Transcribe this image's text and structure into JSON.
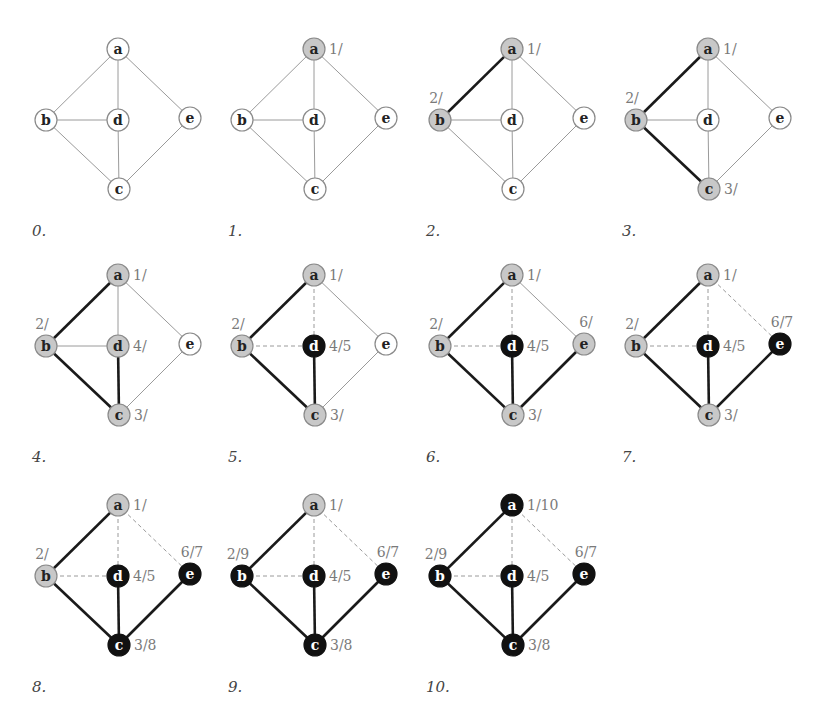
{
  "figure": {
    "colors": {
      "white_fill": "#ffffff",
      "gray_fill": "#c8c8c8",
      "black_fill": "#111111",
      "node_stroke": "#8a8a8a",
      "edge_plain": "#9a9a9a",
      "edge_tree": "#1a1a1a",
      "edge_back": "#9a9a9a",
      "timestamp_text": "#7a7a7a",
      "label_text_light": "#222222",
      "label_text_dark": "#ffffff"
    },
    "vertices": [
      "a",
      "b",
      "c",
      "d",
      "e"
    ],
    "edges": [
      [
        "a",
        "b"
      ],
      [
        "a",
        "d"
      ],
      [
        "a",
        "e"
      ],
      [
        "b",
        "d"
      ],
      [
        "b",
        "c"
      ],
      [
        "d",
        "c"
      ],
      [
        "e",
        "c"
      ]
    ],
    "layout": {
      "a": [
        118,
        49
      ],
      "b": [
        46,
        120
      ],
      "d": [
        118,
        120
      ],
      "e": [
        190,
        118
      ],
      "c": [
        119,
        189
      ]
    },
    "panels": [
      {
        "label": "0.",
        "offset": [
          0,
          0
        ],
        "nodes": {
          "a": "white",
          "b": "white",
          "c": "white",
          "d": "white",
          "e": "white"
        },
        "times": {},
        "tree_edges": [],
        "back_edges": []
      },
      {
        "label": "1.",
        "offset": [
          196,
          0
        ],
        "nodes": {
          "a": "gray",
          "b": "white",
          "c": "white",
          "d": "white",
          "e": "white"
        },
        "times": {
          "a": "1/"
        },
        "tree_edges": [],
        "back_edges": []
      },
      {
        "label": "2.",
        "offset": [
          394,
          0
        ],
        "nodes": {
          "a": "gray",
          "b": "gray",
          "c": "white",
          "d": "white",
          "e": "white"
        },
        "times": {
          "a": "1/",
          "b": "2/"
        },
        "tree_edges": [
          [
            "a",
            "b"
          ]
        ],
        "back_edges": []
      },
      {
        "label": "3.",
        "offset": [
          590,
          0
        ],
        "nodes": {
          "a": "gray",
          "b": "gray",
          "c": "gray",
          "d": "white",
          "e": "white"
        },
        "times": {
          "a": "1/",
          "b": "2/",
          "c": "3/"
        },
        "tree_edges": [
          [
            "a",
            "b"
          ],
          [
            "b",
            "c"
          ]
        ],
        "back_edges": []
      },
      {
        "label": "4.",
        "offset": [
          0,
          226
        ],
        "nodes": {
          "a": "gray",
          "b": "gray",
          "c": "gray",
          "d": "gray",
          "e": "white"
        },
        "times": {
          "a": "1/",
          "b": "2/",
          "c": "3/",
          "d": "4/"
        },
        "tree_edges": [
          [
            "a",
            "b"
          ],
          [
            "b",
            "c"
          ],
          [
            "d",
            "c"
          ]
        ],
        "back_edges": []
      },
      {
        "label": "5.",
        "offset": [
          196,
          226
        ],
        "nodes": {
          "a": "gray",
          "b": "gray",
          "c": "gray",
          "d": "black",
          "e": "white"
        },
        "times": {
          "a": "1/",
          "b": "2/",
          "c": "3/",
          "d": "4/5"
        },
        "tree_edges": [
          [
            "a",
            "b"
          ],
          [
            "b",
            "c"
          ],
          [
            "d",
            "c"
          ]
        ],
        "back_edges": [
          [
            "a",
            "d"
          ],
          [
            "b",
            "d"
          ]
        ]
      },
      {
        "label": "6.",
        "offset": [
          394,
          226
        ],
        "nodes": {
          "a": "gray",
          "b": "gray",
          "c": "gray",
          "d": "black",
          "e": "gray"
        },
        "times": {
          "a": "1/",
          "b": "2/",
          "c": "3/",
          "d": "4/5",
          "e": "6/"
        },
        "tree_edges": [
          [
            "a",
            "b"
          ],
          [
            "b",
            "c"
          ],
          [
            "d",
            "c"
          ],
          [
            "e",
            "c"
          ]
        ],
        "back_edges": [
          [
            "a",
            "d"
          ],
          [
            "b",
            "d"
          ]
        ]
      },
      {
        "label": "7.",
        "offset": [
          590,
          226
        ],
        "nodes": {
          "a": "gray",
          "b": "gray",
          "c": "gray",
          "d": "black",
          "e": "black"
        },
        "times": {
          "a": "1/",
          "b": "2/",
          "c": "3/",
          "d": "4/5",
          "e": "6/7"
        },
        "tree_edges": [
          [
            "a",
            "b"
          ],
          [
            "b",
            "c"
          ],
          [
            "d",
            "c"
          ],
          [
            "e",
            "c"
          ]
        ],
        "back_edges": [
          [
            "a",
            "d"
          ],
          [
            "b",
            "d"
          ],
          [
            "a",
            "e"
          ]
        ]
      },
      {
        "label": "8.",
        "offset": [
          0,
          456
        ],
        "nodes": {
          "a": "gray",
          "b": "gray",
          "c": "black",
          "d": "black",
          "e": "black"
        },
        "times": {
          "a": "1/",
          "b": "2/",
          "c": "3/8",
          "d": "4/5",
          "e": "6/7"
        },
        "tree_edges": [
          [
            "a",
            "b"
          ],
          [
            "b",
            "c"
          ],
          [
            "d",
            "c"
          ],
          [
            "e",
            "c"
          ]
        ],
        "back_edges": [
          [
            "a",
            "d"
          ],
          [
            "b",
            "d"
          ],
          [
            "a",
            "e"
          ]
        ]
      },
      {
        "label": "9.",
        "offset": [
          196,
          456
        ],
        "nodes": {
          "a": "gray",
          "b": "black",
          "c": "black",
          "d": "black",
          "e": "black"
        },
        "times": {
          "a": "1/",
          "b": "2/9",
          "c": "3/8",
          "d": "4/5",
          "e": "6/7"
        },
        "tree_edges": [
          [
            "a",
            "b"
          ],
          [
            "b",
            "c"
          ],
          [
            "d",
            "c"
          ],
          [
            "e",
            "c"
          ]
        ],
        "back_edges": [
          [
            "a",
            "d"
          ],
          [
            "b",
            "d"
          ],
          [
            "a",
            "e"
          ]
        ]
      },
      {
        "label": "10.",
        "offset": [
          394,
          456
        ],
        "nodes": {
          "a": "black",
          "b": "black",
          "c": "black",
          "d": "black",
          "e": "black"
        },
        "times": {
          "a": "1/10",
          "b": "2/9",
          "c": "3/8",
          "d": "4/5",
          "e": "6/7"
        },
        "tree_edges": [
          [
            "a",
            "b"
          ],
          [
            "b",
            "c"
          ],
          [
            "d",
            "c"
          ],
          [
            "e",
            "c"
          ]
        ],
        "back_edges": [
          [
            "a",
            "d"
          ],
          [
            "b",
            "d"
          ],
          [
            "a",
            "e"
          ]
        ]
      }
    ]
  }
}
